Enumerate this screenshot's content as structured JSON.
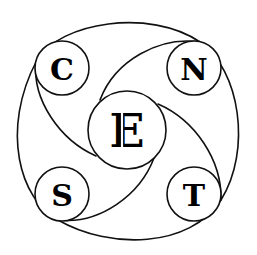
{
  "diagram": {
    "type": "pinwheel-logo",
    "stroke_color": "#111111",
    "background": "#ffffff",
    "center": {
      "label": "E",
      "cx": 127,
      "cy": 130,
      "r": 39
    },
    "nodes": [
      {
        "id": "c",
        "label": "C",
        "cx": 62,
        "cy": 68,
        "r": 27
      },
      {
        "id": "n",
        "label": "N",
        "cx": 194,
        "cy": 68,
        "r": 27
      },
      {
        "id": "s",
        "label": "S",
        "cx": 62,
        "cy": 194,
        "r": 27
      },
      {
        "id": "t",
        "label": "T",
        "cx": 194,
        "cy": 194,
        "r": 27
      }
    ]
  }
}
